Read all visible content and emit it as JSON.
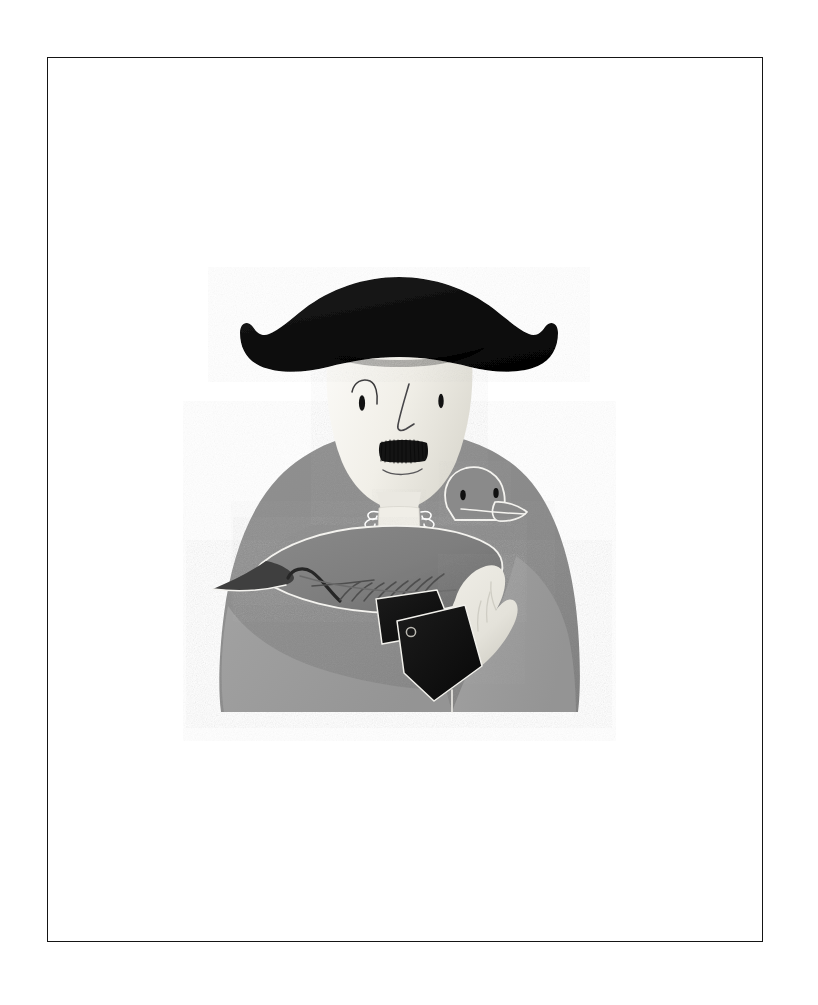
{
  "plate": {
    "frame": {
      "x": 47,
      "y": 57,
      "width": 716,
      "height": 885,
      "stroke_color": "#151515",
      "stroke_width": 1.6,
      "fill_color": "#ffffff"
    },
    "canvas": {
      "width": 818,
      "height": 1005,
      "background_color": "#ffffff"
    }
  },
  "artwork": {
    "title": "Man in Bicorne Hat Holding a Pigeon",
    "style": "flat vector illustration, grayscale, subtle paper grain",
    "palette": {
      "paper_white": "#ffffff",
      "ink_black": "#0d0d0d",
      "hat_black": "#0f0f0f",
      "face_cream": "#f2f0ea",
      "face_shadow": "#d9d7cf",
      "coat_gray": "#8b8b8b",
      "coat_gray_light": "#9b9b9b",
      "coat_gray_dark": "#7e7e7e",
      "bird_gray": "#808080",
      "bird_gray_dark": "#6e6e6e",
      "bird_belly": "#8d8d8d",
      "hand_cream": "#e9e7df",
      "hand_shadow": "#d5d3ca",
      "outline_light": "#f4f3ef",
      "cuff_black": "#111111"
    },
    "figure": {
      "bounds": {
        "x": 210,
        "y": 275,
        "width": 370,
        "height": 440
      },
      "hat": {
        "name": "bicorne-hat",
        "color": "#0f0f0f",
        "brim_left_x": 238,
        "brim_right_x": 552,
        "crown_top_y": 277,
        "brim_bottom_y": 372
      },
      "head": {
        "name": "head",
        "color": "#f2f0ea",
        "center_x": 399,
        "top_y": 352,
        "chin_y": 505,
        "width": 146
      },
      "face_features": {
        "left_eye": {
          "cx": 362,
          "cy": 402,
          "rx": 3.0,
          "ry": 7.5,
          "color": "#121212"
        },
        "right_eye": {
          "cx": 441,
          "cy": 400,
          "rx": 2.6,
          "ry": 7.0,
          "color": "#121212"
        },
        "eyebrow": {
          "from_x": 352,
          "to_x": 377,
          "y": 386,
          "color": "#2b2b2b"
        },
        "nose": {
          "top_x": 408,
          "top_y": 385,
          "tip_x": 404,
          "tip_y": 428,
          "color": "#3a3a3a"
        },
        "mustache": {
          "cx": 403,
          "cy": 448,
          "width": 46,
          "height": 15,
          "color": "#141414"
        },
        "mouth": {
          "cx": 403,
          "cy": 470,
          "width": 40,
          "color": "#4a4a4a"
        }
      },
      "cravat": {
        "name": "cravat-jabot",
        "color": "#efedE6",
        "cx": 399,
        "cy": 515,
        "ruffle_count": 6
      },
      "torso": {
        "name": "coat-torso",
        "color": "#8b8b8b",
        "left_x": 218,
        "right_x": 580,
        "top_y": 428,
        "bottom_y": 713
      },
      "forearms": {
        "name": "crossed-forearms",
        "color": "#9b9b9b",
        "left_x": 226,
        "right_x": 520
      },
      "cuffs": [
        {
          "name": "cuff-upper",
          "color": "#111111",
          "cx": 400,
          "cy": 612
        },
        {
          "name": "cuff-lower",
          "color": "#111111",
          "cx": 430,
          "cy": 655,
          "has_button": true,
          "button_color": "#b9b7b0"
        }
      ],
      "hand": {
        "name": "right-hand",
        "color": "#e9e7df",
        "cx": 480,
        "cy": 600,
        "finger_count": 4
      }
    },
    "bird": {
      "name": "pigeon",
      "body_color": "#808080",
      "head_color": "#8a8a8a",
      "outline_color": "#f4f3ef",
      "body": {
        "left_tip_x": 216,
        "right_x": 500,
        "top_y": 525,
        "bottom_y": 600
      },
      "head": {
        "cx": 474,
        "cy": 500,
        "rx": 32,
        "ry": 34
      },
      "eyes": [
        {
          "cx": 463,
          "cy": 494,
          "rx": 2.6,
          "ry": 5.0,
          "color": "#101010"
        },
        {
          "cx": 497,
          "cy": 493,
          "rx": 2.6,
          "ry": 5.0,
          "color": "#101010"
        }
      ],
      "beak": {
        "tip_x": 527,
        "tip_y": 516,
        "color": "#8a8a8a",
        "outline_color": "#f4f3ef"
      },
      "tail": {
        "tip_x": 213,
        "tip_y": 589,
        "color": "#3b3b3b"
      },
      "wing": {
        "hook_color": "#2a2a2a",
        "feather_line_count": 9,
        "feather_color": "#4d4d4d"
      }
    }
  },
  "chart_data": null
}
